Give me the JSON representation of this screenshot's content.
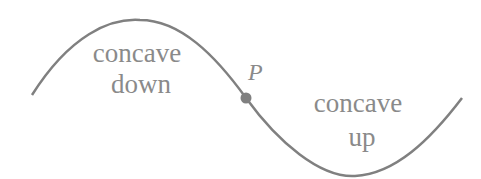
{
  "diagram": {
    "labels": {
      "left_line1": "concave",
      "left_line2": "down",
      "right_line1": "concave",
      "right_line2": "up",
      "point": "P"
    },
    "colors": {
      "curve": "#808080",
      "text": "#8a8a8a",
      "point": "#808080"
    },
    "curve": "sinusoid with inflection point P between concave-down and concave-up regions"
  }
}
